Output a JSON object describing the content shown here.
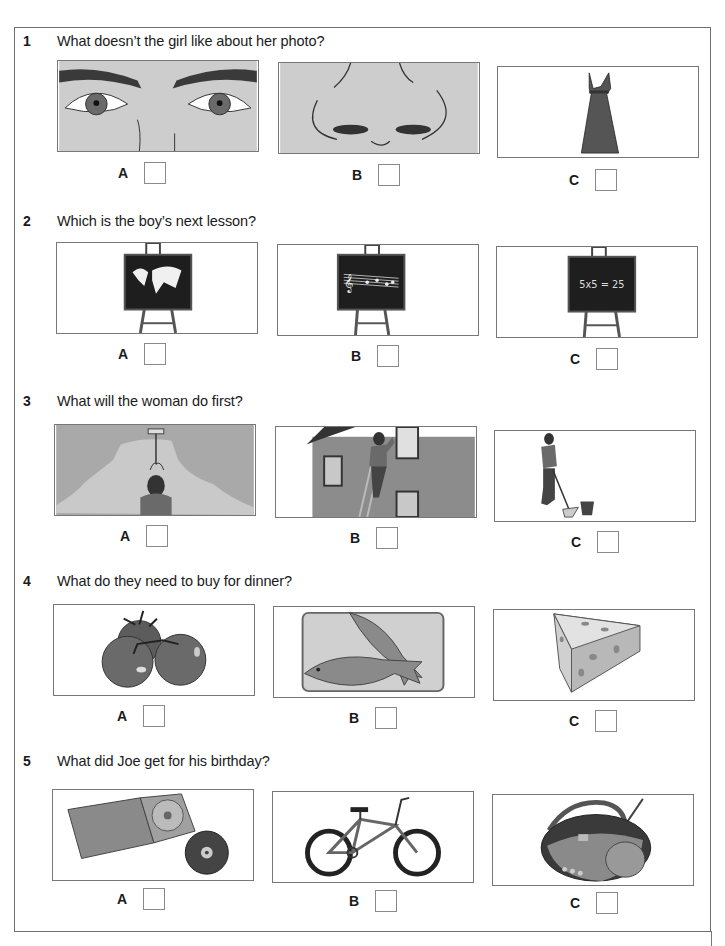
{
  "questions": [
    {
      "number": "1",
      "text": "What doesn’t the girl like about her photo?",
      "options": [
        {
          "letter": "A",
          "image": "eyes",
          "checked": false
        },
        {
          "letter": "B",
          "image": "nose",
          "checked": false
        },
        {
          "letter": "C",
          "image": "dress",
          "checked": false
        }
      ]
    },
    {
      "number": "2",
      "text": "Which is the boy’s next lesson?",
      "options": [
        {
          "letter": "A",
          "image": "blackboard-world-map",
          "checked": false
        },
        {
          "letter": "B",
          "image": "blackboard-music-notes",
          "checked": false
        },
        {
          "letter": "C",
          "image": "blackboard-maths",
          "board_text": "5x5 = 25",
          "checked": false
        }
      ]
    },
    {
      "number": "3",
      "text": "What will the woman do first?",
      "options": [
        {
          "letter": "A",
          "image": "woman-painting-wall",
          "checked": false
        },
        {
          "letter": "B",
          "image": "woman-cleaning-window",
          "checked": false
        },
        {
          "letter": "C",
          "image": "woman-mopping-floor",
          "checked": false
        }
      ]
    },
    {
      "number": "4",
      "text": "What do they need to buy for dinner?",
      "options": [
        {
          "letter": "A",
          "image": "tomatoes",
          "checked": false
        },
        {
          "letter": "B",
          "image": "fish",
          "checked": false
        },
        {
          "letter": "C",
          "image": "cheese",
          "checked": false
        }
      ]
    },
    {
      "number": "5",
      "text": "What did Joe get for his birthday?",
      "options": [
        {
          "letter": "A",
          "image": "cd",
          "checked": false
        },
        {
          "letter": "B",
          "image": "bicycle",
          "checked": false
        },
        {
          "letter": "C",
          "image": "cd-player-radio",
          "checked": false
        }
      ]
    }
  ],
  "colors": {
    "frame_border": "#6e6e6e",
    "picture_fill": "#cfcfcf",
    "dark_fill": "#3a3a3a"
  }
}
